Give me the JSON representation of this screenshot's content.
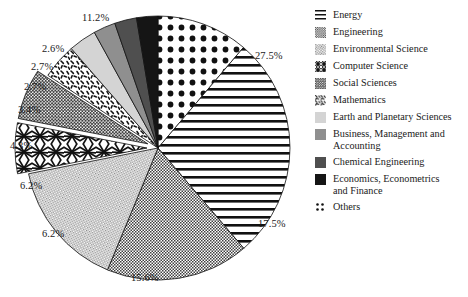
{
  "chart_data": {
    "type": "pie",
    "title": "",
    "labels": [
      "Others",
      "Energy",
      "Engineering",
      "Environmental Science",
      "Computer Science",
      "Social Sciences",
      "Mathematics",
      "Earth and Planetary Sciences",
      "Business, Management and Accounting",
      "Chemical Engineering",
      "Economics, Econometrics and Finance"
    ],
    "values": [
      11.2,
      27.5,
      17.5,
      15.6,
      6.2,
      6.2,
      4.3,
      3.4,
      2.7,
      2.7,
      2.6
    ],
    "value_labels": [
      "11.2%",
      "27.5%",
      "17.5%",
      "15.6%",
      "6.2%",
      "6.2%",
      "4.3%",
      "3.4%",
      "2.7%",
      "2.7%",
      "2.6%"
    ],
    "units": "percent",
    "legend_position": "right",
    "grid": false,
    "xlabel": "",
    "ylabel": ""
  },
  "pie": {
    "slices": [
      {
        "key": "others",
        "label": "Others",
        "value": 11.2,
        "value_label": "11.2%",
        "pattern": "polka-dots",
        "fill": "#ffffff",
        "ink": "#111111",
        "exploded": false
      },
      {
        "key": "energy",
        "label": "Energy",
        "value": 27.5,
        "value_label": "27.5%",
        "pattern": "horizontal-lines",
        "fill": "#ffffff",
        "ink": "#111111",
        "exploded": false
      },
      {
        "key": "engineering",
        "label": "Engineering",
        "value": 17.5,
        "value_label": "17.5%",
        "pattern": "fine-checker",
        "fill": "#ffffff",
        "ink": "#3a3a3a",
        "exploded": false
      },
      {
        "key": "envsci",
        "label": "Environmental Science",
        "value": 15.6,
        "value_label": "15.6%",
        "pattern": "fine-diagonal",
        "fill": "#ffffff",
        "ink": "#7a7a7a",
        "exploded": false
      },
      {
        "key": "compsci",
        "label": "Computer Science",
        "value": 6.2,
        "value_label": "6.2%",
        "pattern": "crosshatch-rough",
        "fill": "#ffffff",
        "ink": "#111111",
        "exploded": true
      },
      {
        "key": "socsci",
        "label": "Social Sciences",
        "value": 6.2,
        "value_label": "6.2%",
        "pattern": "dense-dots",
        "fill": "#ffffff",
        "ink": "#4a4a4a",
        "exploded": true
      },
      {
        "key": "math",
        "label": "Mathematics",
        "value": 4.3,
        "value_label": "4.3%",
        "pattern": "speckle-dashes",
        "fill": "#ffffff",
        "ink": "#111111",
        "exploded": false
      },
      {
        "key": "earth",
        "label": "Earth and Planetary Sciences",
        "value": 3.4,
        "value_label": "3.4%",
        "pattern": "solid",
        "fill": "#d4d4d4",
        "ink": "#d4d4d4",
        "exploded": false
      },
      {
        "key": "business",
        "label": "Business, Management and Accounting",
        "value": 2.7,
        "value_label": "2.7%",
        "pattern": "solid",
        "fill": "#8f8f8f",
        "ink": "#8f8f8f",
        "exploded": false
      },
      {
        "key": "chemeng",
        "label": "Chemical Engineering",
        "value": 2.7,
        "value_label": "2.7%",
        "pattern": "solid",
        "fill": "#4f4f4f",
        "ink": "#4f4f4f",
        "exploded": false
      },
      {
        "key": "economics",
        "label": "Economics, Econometrics and Finance",
        "value": 2.6,
        "value_label": "2.6%",
        "pattern": "solid",
        "fill": "#151515",
        "ink": "#151515",
        "exploded": false
      }
    ]
  },
  "legend": {
    "items": [
      {
        "key": "energy",
        "label": "Energy",
        "swatch": "horizontal-lines"
      },
      {
        "key": "engineering",
        "label": "Engineering",
        "swatch": "fine-checker"
      },
      {
        "key": "envsci",
        "label": "Environmental Science",
        "swatch": "fine-diagonal"
      },
      {
        "key": "compsci",
        "label": "Computer Science",
        "swatch": "crosshatch-rough"
      },
      {
        "key": "socsci",
        "label": "Social Sciences",
        "swatch": "dense-dots"
      },
      {
        "key": "math",
        "label": "Mathematics",
        "swatch": "speckle-dashes"
      },
      {
        "key": "earth",
        "label": "Earth and Planetary Sciences",
        "swatch": "solid-light"
      },
      {
        "key": "business",
        "label": "Business, Management and\nAccounting",
        "swatch": "solid-mid"
      },
      {
        "key": "chemeng",
        "label": "Chemical Engineering",
        "swatch": "solid-dark"
      },
      {
        "key": "economics",
        "label": "Economics, Econometrics\nand Finance",
        "swatch": "solid-black"
      },
      {
        "key": "others",
        "label": "Others",
        "swatch": "polka-dots"
      }
    ]
  }
}
